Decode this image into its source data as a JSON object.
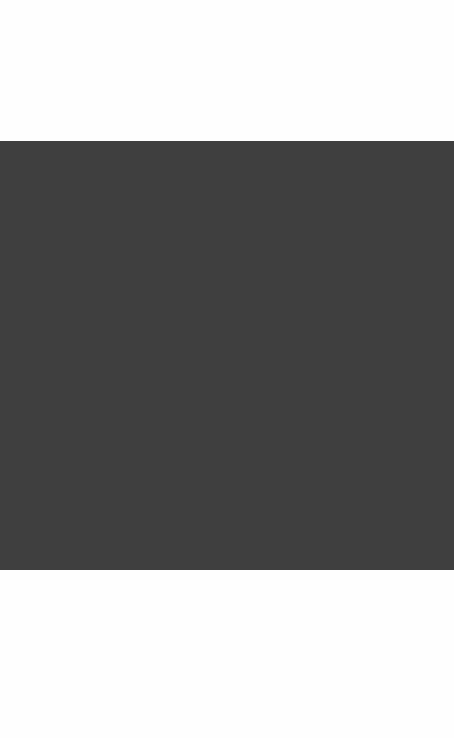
{
  "canvas": {
    "width": 454,
    "height": 738,
    "background_color": "#fefefe"
  },
  "content_panel": {
    "fill_color": "#3f3f3f",
    "x": 0,
    "y": 141,
    "width": 454,
    "height": 429,
    "empty_state_text": ""
  },
  "letterbox": {
    "color": "#fefefe",
    "top_height": 141,
    "bottom_height": 168
  }
}
